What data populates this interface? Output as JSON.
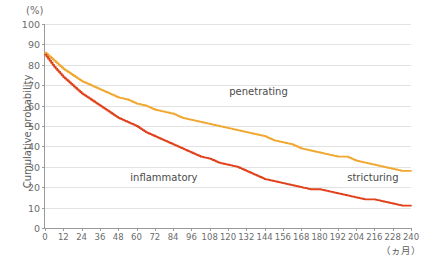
{
  "axes": {
    "y_unit_label": "(%)",
    "y_title": "Cumulative probability",
    "x_unit_label": "（ヵ月）",
    "y_ticks": [
      "0",
      "10",
      "20",
      "30",
      "40",
      "50",
      "60",
      "70",
      "80",
      "90",
      "100"
    ],
    "x_ticks": [
      "0",
      "12",
      "24",
      "36",
      "48",
      "60",
      "72",
      "84",
      "96",
      "108",
      "120",
      "132",
      "144",
      "156",
      "168",
      "180",
      "192",
      "204",
      "216",
      "228",
      "240"
    ]
  },
  "labels": {
    "penetrating": "penetrating",
    "inflammatory": "inflammatory",
    "stricturing": "stricturing"
  },
  "colors": {
    "penetrating_curve": "#F0A830",
    "stricturing_curve": "#E0411A",
    "grid": "#e2e2e2",
    "axis": "#9a9a9a",
    "text": "#5d5d5d"
  },
  "chart_data": {
    "type": "line",
    "title": "",
    "subtitle": "",
    "xlabel": "（ヵ月）",
    "ylabel": "Cumulative probability",
    "y_unit": "(%)",
    "xlim": [
      0,
      240
    ],
    "ylim": [
      0,
      100
    ],
    "x_tick_interval": 12,
    "y_tick_interval": 10,
    "grid": true,
    "legend_position": "inline-annotations",
    "annotations": [
      {
        "text": "penetrating",
        "x": 140,
        "y": 67
      },
      {
        "text": "inflammatory",
        "x": 78,
        "y": 25
      },
      {
        "text": "stricturing",
        "x": 215,
        "y": 25
      }
    ],
    "series": [
      {
        "name": "penetrating",
        "color": "#F0A830",
        "step": true,
        "x": [
          0,
          6,
          12,
          18,
          24,
          30,
          36,
          42,
          48,
          54,
          60,
          66,
          72,
          78,
          84,
          90,
          96,
          102,
          108,
          114,
          120,
          126,
          132,
          138,
          144,
          150,
          156,
          162,
          168,
          174,
          180,
          186,
          192,
          198,
          204,
          210,
          216,
          222,
          228,
          234,
          240
        ],
        "y": [
          86,
          82,
          78,
          75,
          72,
          70,
          68,
          66,
          64,
          63,
          61,
          60,
          58,
          57,
          56,
          54,
          53,
          52,
          51,
          50,
          49,
          48,
          47,
          46,
          45,
          43,
          42,
          41,
          39,
          38,
          37,
          36,
          35,
          35,
          33,
          32,
          31,
          30,
          29,
          28,
          28
        ]
      },
      {
        "name": "stricturing",
        "color": "#E0411A",
        "step": true,
        "x": [
          0,
          6,
          12,
          18,
          24,
          30,
          36,
          42,
          48,
          54,
          60,
          66,
          72,
          78,
          84,
          90,
          96,
          102,
          108,
          114,
          120,
          126,
          132,
          138,
          144,
          150,
          156,
          162,
          168,
          174,
          180,
          186,
          192,
          198,
          204,
          210,
          216,
          222,
          228,
          234,
          240
        ],
        "y": [
          85,
          79,
          74,
          70,
          66,
          63,
          60,
          57,
          54,
          52,
          50,
          47,
          45,
          43,
          41,
          39,
          37,
          35,
          34,
          32,
          31,
          30,
          28,
          26,
          24,
          23,
          22,
          21,
          20,
          19,
          19,
          18,
          17,
          16,
          15,
          14,
          14,
          13,
          12,
          11,
          11
        ]
      }
    ]
  }
}
